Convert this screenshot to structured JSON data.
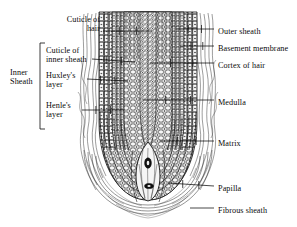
{
  "figure": {
    "style": {
      "ink": "#0b0b0b",
      "background": "#ffffff",
      "cell_fill": "#e9e9e9",
      "shade": "#bdbdbd",
      "dark_nucleus": "#141414"
    }
  },
  "group_labels": [
    {
      "id": "inner-sheath",
      "text": "Inner\nSheath",
      "x": 10,
      "y": 67,
      "align": "left",
      "bracket": {
        "x": 40,
        "y_top": 43,
        "y_bottom": 129,
        "tick": 5
      }
    }
  ],
  "left_labels": [
    {
      "id": "cuticle-of-hair",
      "text": "Cuticle of\nhair",
      "text_x": 100,
      "text_y": 14,
      "align": "right",
      "leader": {
        "x1": 103,
        "y1": 31,
        "x2": 152,
        "y2": 31,
        "tick": true
      }
    },
    {
      "id": "cuticle-of-inner-sheath",
      "text": "Cuticle of\ninner sheath",
      "text_x": 46,
      "text_y": 45,
      "align": "left",
      "leader": {
        "x1": 92,
        "y1": 59,
        "x2": 135,
        "y2": 62,
        "tick": true
      }
    },
    {
      "id": "huxleys-layer",
      "text": "Huxley's\nlayer",
      "text_x": 46,
      "text_y": 70,
      "align": "left",
      "leader": {
        "x1": 87,
        "y1": 79,
        "x2": 128,
        "y2": 81,
        "tick": true
      }
    },
    {
      "id": "henles-layer",
      "text": "Henle's\nlayer",
      "text_x": 46,
      "text_y": 100,
      "align": "left",
      "leader": {
        "x1": 82,
        "y1": 110,
        "x2": 124,
        "y2": 110,
        "tick": true
      }
    }
  ],
  "right_labels": [
    {
      "id": "outer-sheath",
      "text": "Outer sheath",
      "text_x": 218,
      "text_y": 26,
      "align": "left",
      "leader": {
        "x1": 214,
        "y1": 29,
        "x2": 176,
        "y2": 29,
        "tick": true
      }
    },
    {
      "id": "basement-membrane",
      "text": "Basement membrane",
      "text_x": 218,
      "text_y": 43,
      "align": "left",
      "leader": {
        "x1": 214,
        "y1": 46,
        "x2": 180,
        "y2": 46,
        "tick": true
      }
    },
    {
      "id": "cortex-of-hair",
      "text": "Cortex of hair",
      "text_x": 218,
      "text_y": 60,
      "align": "left",
      "leader": {
        "x1": 214,
        "y1": 63,
        "x2": 150,
        "y2": 63,
        "tick": true
      }
    },
    {
      "id": "medulla",
      "text": "Medulla",
      "text_x": 218,
      "text_y": 97,
      "align": "left",
      "leader": {
        "x1": 214,
        "y1": 100,
        "x2": 143,
        "y2": 100,
        "tick": true
      }
    },
    {
      "id": "matrix",
      "text": "Matrix",
      "text_x": 218,
      "text_y": 138,
      "align": "left",
      "leader": {
        "x1": 214,
        "y1": 141,
        "x2": 160,
        "y2": 141,
        "tick": true
      }
    },
    {
      "id": "papilla",
      "text": "Papilla",
      "text_x": 218,
      "text_y": 183,
      "align": "left",
      "leader": {
        "x1": 214,
        "y1": 186,
        "x2": 168,
        "y2": 183,
        "tick": true
      }
    },
    {
      "id": "fibrous-sheath",
      "text": "Fibrous sheath",
      "text_x": 218,
      "text_y": 205,
      "align": "left",
      "leader": {
        "x1": 214,
        "y1": 208,
        "x2": 190,
        "y2": 208,
        "tick": false
      }
    }
  ]
}
